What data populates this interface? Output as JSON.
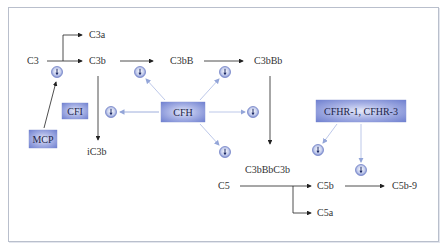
{
  "diagram": {
    "title": "",
    "nodes": {
      "c3": "C3",
      "c3a": "C3a",
      "c3b": "C3b",
      "ic3b": "iC3b",
      "c3bB": "C3bB",
      "c3bBb": "C3bBb",
      "c3bBbC3b": "C3bBbC3b",
      "c5": "C5",
      "c5b": "C5b",
      "c5a": "C5a",
      "c5b9": "C5b-9"
    },
    "regulators": {
      "mcp": "MCP",
      "cfi": "CFI",
      "cfh": "CFH",
      "cfhr": "CFHR-1, CFHR-3"
    },
    "inhibition_icon": "inhibition-icon",
    "colors": {
      "regulator_box": "#8a98dc",
      "regulator_arrow": "#9fb0dc",
      "pathway_arrow": "#222222",
      "frame_border": "#b9bfcc"
    }
  }
}
